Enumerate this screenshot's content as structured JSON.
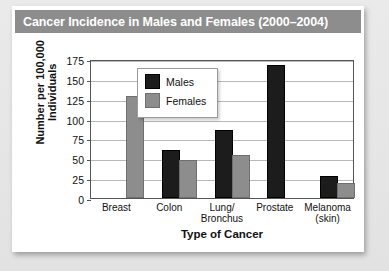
{
  "chart_data": {
    "type": "bar",
    "title": "Cancer Incidence in Males and Females (2000–2004)",
    "xlabel": "Type of Cancer",
    "ylabel": "Number per 100,000 Individuals",
    "ylabel_line1": "Number per 100,000",
    "ylabel_line2": "Individuals",
    "categories": [
      "Breast",
      "Colon",
      "Lung/ Bronchus",
      "Prostate",
      "Melanoma (skin)"
    ],
    "category_lines": [
      [
        "Breast"
      ],
      [
        "Colon"
      ],
      [
        "Lung/",
        "Bronchus"
      ],
      [
        "Prostate"
      ],
      [
        "Melanoma",
        "(skin)"
      ]
    ],
    "series": [
      {
        "name": "Males",
        "color": "#1c1c1c",
        "values": [
          0,
          58,
          83,
          165,
          25
        ]
      },
      {
        "name": "Females",
        "color": "#8d8d8d",
        "values": [
          126,
          45,
          52,
          0,
          16
        ]
      }
    ],
    "ylim": [
      0,
      175
    ],
    "ytick_values": [
      175,
      150,
      125,
      100,
      75,
      50,
      25,
      0
    ],
    "ytick_labels": [
      "175",
      "150",
      "125",
      "100",
      "75",
      "50",
      "25",
      "0"
    ],
    "grid": true,
    "legend_position": "upper-left-inside"
  },
  "legend": {
    "entries": [
      {
        "label": "Males",
        "swatch": "black-square-swatch"
      },
      {
        "label": "Females",
        "swatch": "gray-square-swatch"
      }
    ]
  }
}
